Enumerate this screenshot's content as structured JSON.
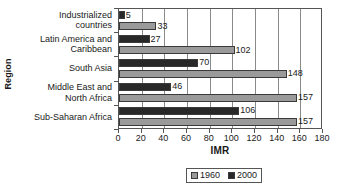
{
  "chart_data": {
    "type": "bar",
    "orientation": "horizontal",
    "title": "",
    "xlabel": "IMR",
    "ylabel": "Region",
    "xlim": [
      0,
      180
    ],
    "xticks": [
      0,
      20,
      40,
      60,
      80,
      100,
      120,
      140,
      160,
      180
    ],
    "grid": true,
    "legend_position": "bottom",
    "categories": [
      "Industrialized countries",
      "Latin America and Caribbean",
      "South Asia",
      "Middle East and North Africa",
      "Sub-Saharan Africa"
    ],
    "category_lines": [
      [
        "Industrialized",
        "countries"
      ],
      [
        "Latin America and",
        "Caribbean"
      ],
      [
        "South Asia"
      ],
      [
        "Middle East and",
        "North Africa"
      ],
      [
        "Sub-Saharan Africa"
      ]
    ],
    "series": [
      {
        "name": "2000",
        "color": "#282828",
        "values": [
          5,
          27,
          70,
          46,
          106
        ]
      },
      {
        "name": "1960",
        "color": "#9a9a9a",
        "values": [
          33,
          102,
          148,
          157,
          157
        ]
      }
    ]
  },
  "axes": {
    "x_title": "IMR",
    "y_title": "Region",
    "tick_labels": [
      "0",
      "20",
      "40",
      "60",
      "80",
      "100",
      "120",
      "140",
      "160",
      "180"
    ]
  },
  "legend": {
    "items": [
      {
        "label": "1960",
        "color": "#9a9a9a"
      },
      {
        "label": "2000",
        "color": "#282828"
      }
    ]
  },
  "values_text": {
    "industrialized_2000": "5",
    "industrialized_1960": "33",
    "latin_2000": "27",
    "latin_1960": "102",
    "southasia_2000": "70",
    "southasia_1960": "148",
    "mena_2000": "46",
    "mena_1960": "157",
    "ssa_2000": "106",
    "ssa_1960": "157"
  }
}
